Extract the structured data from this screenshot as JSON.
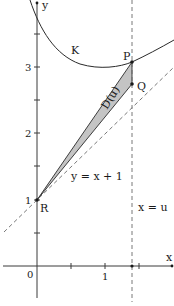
{
  "figure": {
    "axes": {
      "x_label": "x",
      "y_label": "y",
      "origin_label": "0",
      "x_ticks": [
        "1"
      ],
      "y_ticks": [
        "1",
        "2",
        "3"
      ]
    },
    "curve_label": "K",
    "points": {
      "P": "P",
      "Q": "Q",
      "R": "R"
    },
    "region_label": "D(u)",
    "line_label": "y = x + 1",
    "vertical_line_label": "x = u",
    "colors": {
      "axis": "#3a3a3a",
      "curve": "#2a2a2a",
      "region_fill": "#c4c4c4",
      "dashed": "#6a6a6a"
    }
  }
}
